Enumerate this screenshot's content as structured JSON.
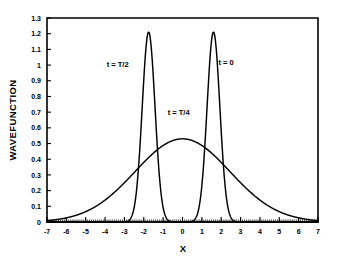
{
  "chart_data": {
    "type": "line",
    "title": "",
    "subtitle": "",
    "xlabel": "X",
    "ylabel": "WAVEFUNCTION",
    "xlim": [
      -7,
      7
    ],
    "ylim": [
      0,
      1.3
    ],
    "grid": false,
    "legend_position": "inline-annotations",
    "x_ticks": [
      -7,
      -6,
      -5,
      -4,
      -3,
      -2,
      -1,
      0,
      1,
      2,
      3,
      4,
      5,
      6,
      7
    ],
    "x_tick_labels": [
      "-7",
      "-6",
      "-5",
      "-4",
      "-3",
      "-2",
      "-1",
      "0",
      "1",
      "2",
      "3",
      "4",
      "5",
      "6",
      "7"
    ],
    "y_ticks": [
      0,
      0.1,
      0.2,
      0.3,
      0.4,
      0.5,
      0.6,
      0.7,
      0.8,
      0.9,
      1.0,
      1.1,
      1.2,
      1.3
    ],
    "y_tick_labels": [
      "0",
      "0.1",
      "0.2",
      "0.3",
      "0.4",
      "0.5",
      "0.6",
      "0.7",
      "0.8",
      "0.9",
      "1",
      "1.1",
      "1.2",
      "1.3"
    ],
    "series": [
      {
        "name": "t = T/2",
        "shape": "gaussian",
        "center": -1.75,
        "peak": 1.21,
        "sigma": 0.33,
        "annotation": "t = T/2",
        "annotation_x": -3.35,
        "annotation_y": 0.99
      },
      {
        "name": "t = 0",
        "shape": "gaussian",
        "center": 1.6,
        "peak": 1.21,
        "sigma": 0.33,
        "annotation": "t = 0",
        "annotation_x": 2.25,
        "annotation_y": 1.0
      },
      {
        "name": "t = T/4",
        "shape": "gaussian",
        "center": 0.0,
        "peak": 0.53,
        "sigma": 2.45,
        "annotation": "t = T/4",
        "annotation_x": -0.2,
        "annotation_y": 0.68
      }
    ],
    "annotations": [
      {
        "text": "t = T/2",
        "x": -3.35,
        "y": 0.99
      },
      {
        "text": "t = 0",
        "x": 2.25,
        "y": 1.0
      },
      {
        "text": "t = T/4",
        "x": -0.2,
        "y": 0.68
      }
    ]
  },
  "axes": {
    "x_title": "X",
    "y_title": "WAVEFUNCTION"
  },
  "colors": {
    "line": "#000000",
    "background": "#ffffff",
    "text": "#000000"
  }
}
